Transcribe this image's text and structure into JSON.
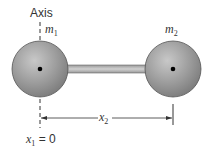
{
  "axis_label": "Axis",
  "mass1_label": "m",
  "mass1_sub": "1",
  "mass2_label": "m",
  "mass2_sub": "2",
  "distance_label": "x",
  "distance_sub": "2",
  "origin_label_var": "x",
  "origin_label_sub": "1",
  "origin_label_eq": " = 0",
  "colors": {
    "sphere_fill": "#8f8f8f",
    "sphere_highlight": "#c4c4c4",
    "rod": "#b0b0b0",
    "line": "#333333"
  }
}
